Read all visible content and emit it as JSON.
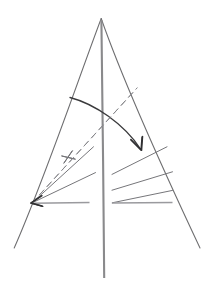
{
  "figure": {
    "title": "",
    "caption": "",
    "background_color": "#ffffff",
    "width": 216,
    "height": 284,
    "style": "hand-drawn pencil line sketch"
  },
  "chart_data": {
    "type": "line",
    "title": "",
    "xlabel": "",
    "ylabel": "",
    "grid": false,
    "legend": "none",
    "xlim": [
      0,
      216
    ],
    "ylim": [
      284,
      0
    ],
    "elements": [
      {
        "name": "left-leg",
        "kind": "line",
        "stroke": "#6e6e70",
        "dashed": false,
        "points": [
          [
            101,
            18
          ],
          [
            14,
            248
          ]
        ]
      },
      {
        "name": "right-leg",
        "kind": "line",
        "stroke": "#6e6e70",
        "dashed": false,
        "points": [
          [
            101,
            18
          ],
          [
            200,
            248
          ]
        ]
      },
      {
        "name": "centre-mast",
        "kind": "line",
        "stroke": "#8a8a8c",
        "dashed": false,
        "points": [
          [
            101,
            19
          ],
          [
            104,
            278
          ]
        ]
      },
      {
        "name": "swing-arc",
        "kind": "arc",
        "stroke": "#3a3a3c",
        "dashed": false,
        "points": [
          [
            70,
            97
          ],
          [
            108,
            120
          ],
          [
            140,
            148
          ]
        ]
      },
      {
        "name": "swing-arrowhead",
        "kind": "arrowhead",
        "stroke": "#303032",
        "tip": [
          141,
          150
        ],
        "barbs": [
          [
            131,
            140
          ],
          [
            142,
            137
          ]
        ]
      },
      {
        "name": "dashed-diagonal",
        "kind": "line",
        "stroke": "#88888c",
        "dashed": true,
        "points": [
          [
            32,
            203
          ],
          [
            137,
            88
          ]
        ]
      },
      {
        "name": "left-fan-upper",
        "kind": "line",
        "stroke": "#76767a",
        "dashed": false,
        "points": [
          [
            32,
            203
          ],
          [
            93,
            147
          ]
        ]
      },
      {
        "name": "left-fan-mid",
        "kind": "line",
        "stroke": "#76767a",
        "dashed": false,
        "points": [
          [
            32,
            203
          ],
          [
            95,
            173
          ]
        ]
      },
      {
        "name": "left-base-line",
        "kind": "line",
        "stroke": "#9a9a9e",
        "dashed": false,
        "points": [
          [
            33,
            203
          ],
          [
            89,
            203
          ]
        ]
      },
      {
        "name": "left-arrowhead",
        "kind": "arrowhead",
        "stroke": "#303032",
        "tip": [
          31,
          203
        ],
        "barbs": [
          [
            41,
            196
          ],
          [
            42,
            206
          ]
        ]
      },
      {
        "name": "right-fan-upper",
        "kind": "line",
        "stroke": "#76767a",
        "dashed": false,
        "points": [
          [
            112,
            174
          ],
          [
            167,
            147
          ]
        ]
      },
      {
        "name": "right-fan-mid",
        "kind": "line",
        "stroke": "#76767a",
        "dashed": false,
        "points": [
          [
            112,
            190
          ],
          [
            172,
            172
          ]
        ]
      },
      {
        "name": "right-base-line",
        "kind": "line",
        "stroke": "#9a9a9e",
        "dashed": false,
        "points": [
          [
            112,
            203
          ],
          [
            172,
            203
          ]
        ]
      },
      {
        "name": "right-base-riser",
        "kind": "line",
        "stroke": "#76767a",
        "dashed": false,
        "points": [
          [
            112,
            203
          ],
          [
            172,
            190
          ]
        ]
      },
      {
        "name": "tick-left",
        "kind": "tick",
        "stroke": "#5e5e62",
        "points": [
          [
            64,
            163
          ],
          [
            72,
            151
          ]
        ]
      },
      {
        "name": "tick-left-2",
        "kind": "tick",
        "stroke": "#5e5e62",
        "points": [
          [
            62,
            156
          ],
          [
            75,
            159
          ]
        ]
      }
    ]
  },
  "annotations": {
    "labels": [],
    "values": []
  }
}
